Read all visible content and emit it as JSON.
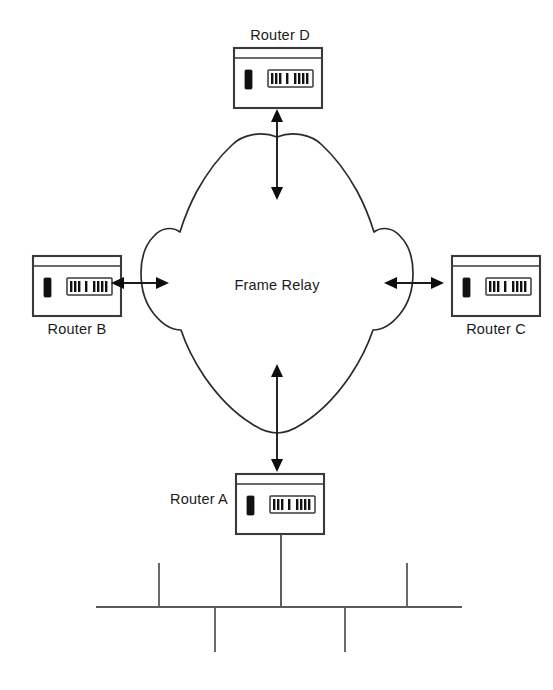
{
  "diagram": {
    "cloud": {
      "label": "Frame Relay",
      "icon": "cloud-icon"
    },
    "nodes": [
      {
        "id": "router-d",
        "label": "Router D",
        "icon": "router-icon",
        "position": "top",
        "label_position": "above"
      },
      {
        "id": "router-b",
        "label": "Router B",
        "icon": "router-icon",
        "position": "left",
        "label_position": "below"
      },
      {
        "id": "router-c",
        "label": "Router C",
        "icon": "router-icon",
        "position": "right",
        "label_position": "below"
      },
      {
        "id": "router-a",
        "label": "Router A",
        "icon": "router-icon",
        "position": "bottom",
        "label_position": "left"
      }
    ],
    "links": [
      {
        "id": "link-cloud-router-d",
        "from": "frame-relay-cloud",
        "to": "router-d",
        "style": "double-arrow",
        "orientation": "vertical"
      },
      {
        "id": "link-cloud-router-b",
        "from": "frame-relay-cloud",
        "to": "router-b",
        "style": "double-arrow",
        "orientation": "horizontal"
      },
      {
        "id": "link-cloud-router-c",
        "from": "frame-relay-cloud",
        "to": "router-c",
        "style": "double-arrow",
        "orientation": "horizontal"
      },
      {
        "id": "link-cloud-router-a",
        "from": "frame-relay-cloud",
        "to": "router-a",
        "style": "double-arrow",
        "orientation": "vertical"
      },
      {
        "id": "link-router-a-lan",
        "from": "router-a",
        "to": "lan-bus",
        "style": "plain-line",
        "orientation": "vertical"
      }
    ],
    "lan": {
      "id": "lan-bus",
      "type": "ethernet-bus",
      "stub_count": 4,
      "stubs": [
        {
          "id": "lan-stub-1",
          "direction": "up"
        },
        {
          "id": "lan-stub-2",
          "direction": "down"
        },
        {
          "id": "lan-stub-3",
          "direction": "down"
        },
        {
          "id": "lan-stub-4",
          "direction": "up"
        }
      ]
    },
    "colors": {
      "background": "#ffffff",
      "line": "#1b1b1b",
      "cloud_stroke": "#2b2b2b",
      "router_stroke": "#3a3a3a",
      "bus_stroke": "#5a5a5a",
      "text": "#1b1b1b"
    }
  }
}
